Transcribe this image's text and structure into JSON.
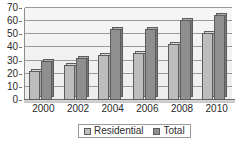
{
  "chart_data": {
    "type": "bar",
    "title": "",
    "subtitle": "",
    "xlabel": "",
    "ylabel": "",
    "categories": [
      "2000",
      "2002",
      "2004",
      "2006",
      "2008",
      "2010"
    ],
    "series": [
      {
        "name": "Residential",
        "values": [
          22,
          27,
          34,
          36,
          43,
          51
        ],
        "color": "#bdbdbd"
      },
      {
        "name": "Total",
        "values": [
          30,
          32,
          54,
          54,
          61,
          65
        ],
        "color": "#8f8f8f"
      }
    ],
    "ylim": [
      0,
      70
    ],
    "ytick_values": [
      0,
      10,
      20,
      30,
      40,
      50,
      60,
      70
    ],
    "ytick_labels": [
      "0",
      "10",
      "20",
      "30",
      "40",
      "50",
      "60",
      "70"
    ],
    "grid": true,
    "grid_axis": "y",
    "legend_position": "bottom",
    "style": "3d-column",
    "plot_background": "#f2f2f2",
    "axis_color": "#6e6e6e",
    "gridline_color": "#9a9a9a",
    "text_color": "#2b2b2b"
  },
  "legend": {
    "items": [
      {
        "label": "Residential",
        "swatch": "residential"
      },
      {
        "label": "Total",
        "swatch": "total"
      }
    ]
  }
}
